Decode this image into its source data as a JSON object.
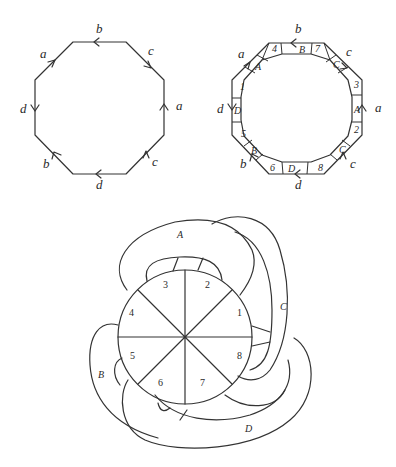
{
  "figure_left": {
    "title": "",
    "edge_labels": {
      "top": "b",
      "top_right": "c",
      "right": "a",
      "bottom_right": "c",
      "bottom": "d",
      "bottom_left": "b",
      "left": "d",
      "top_left": "a"
    }
  },
  "figure_right": {
    "edge_labels": {
      "top": "b",
      "top_right": "c",
      "right": "a",
      "bottom_right": "c",
      "bottom": "d",
      "bottom_left": "b",
      "left": "d",
      "top_left": "a"
    },
    "band_labels": {
      "top": "B",
      "top_right": "C",
      "right": "A",
      "bottom_right": "C",
      "bottom": "D",
      "bottom_left": "B",
      "left": "D",
      "top_left": "A"
    },
    "corner_numbers": {
      "top_left_corner": "4",
      "top_right_corner": "7",
      "right_top_corner": "3",
      "right_bottom_corner": "2",
      "bottom_right_corner": "8",
      "bottom_left_corner": "6",
      "left_bottom_corner": "5",
      "left_top_corner": "1"
    }
  },
  "figure_bottom": {
    "sector_labels": [
      "1",
      "2",
      "3",
      "4",
      "5",
      "6",
      "7",
      "8"
    ],
    "band_labels": {
      "A": "A",
      "B": "B",
      "C": "C",
      "D": "D"
    }
  }
}
